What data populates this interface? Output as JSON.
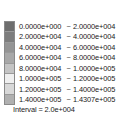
{
  "legend": {
    "interval_label": "Interval =  2.0e+004",
    "separator": "~",
    "rows": [
      {
        "low": "0.0000e+000",
        "high": "2.0000e+004",
        "color": "#6e6e6e"
      },
      {
        "low": "2.0000e+004",
        "high": "4.0000e+004",
        "color": "#7d7d7d"
      },
      {
        "low": "4.0000e+004",
        "high": "6.0000e+004",
        "color": "#949494"
      },
      {
        "low": "6.0000e+004",
        "high": "8.0000e+004",
        "color": "#a8a8a8"
      },
      {
        "low": "8.0000e+004",
        "high": "1.0000e+005",
        "color": "#c4c4c4"
      },
      {
        "low": "1.0000e+005",
        "high": "1.2000e+005",
        "color": "#efefef"
      },
      {
        "low": "1.2000e+005",
        "high": "1.4000e+005",
        "color": "#d8d8d8"
      },
      {
        "low": "1.4000e+005",
        "high": "1.4307e+005",
        "color": "#b0b0b0"
      }
    ]
  },
  "chart_data": {
    "type": "table",
    "title": "",
    "subtitle": "",
    "xlabel": "",
    "ylabel": "",
    "legend_position": "standalone",
    "grid": false,
    "colorbar": {
      "interval": 20000,
      "interval_text": "Interval =  2.0e+004",
      "min": 0.0,
      "max": 143070.0,
      "bin_count": 8,
      "separator": "~",
      "bin_edges": [
        0.0,
        20000.0,
        40000.0,
        60000.0,
        80000.0,
        100000.0,
        120000.0,
        140000.0,
        143070.0
      ],
      "bin_edge_labels": [
        "0.0000e+000",
        "2.0000e+004",
        "4.0000e+004",
        "6.0000e+004",
        "8.0000e+004",
        "1.0000e+005",
        "1.2000e+005",
        "1.4000e+005",
        "1.4307e+005"
      ],
      "bins": [
        {
          "low": 0.0,
          "high": 20000.0,
          "low_label": "0.0000e+000",
          "high_label": "2.0000e+004",
          "color": "#6e6e6e"
        },
        {
          "low": 20000.0,
          "high": 40000.0,
          "low_label": "2.0000e+004",
          "high_label": "4.0000e+004",
          "color": "#7d7d7d"
        },
        {
          "low": 40000.0,
          "high": 60000.0,
          "low_label": "4.0000e+004",
          "high_label": "6.0000e+004",
          "color": "#949494"
        },
        {
          "low": 60000.0,
          "high": 80000.0,
          "low_label": "6.0000e+004",
          "high_label": "8.0000e+004",
          "color": "#a8a8a8"
        },
        {
          "low": 80000.0,
          "high": 100000.0,
          "low_label": "8.0000e+004",
          "high_label": "1.0000e+005",
          "color": "#c4c4c4"
        },
        {
          "low": 100000.0,
          "high": 120000.0,
          "low_label": "1.0000e+005",
          "high_label": "1.2000e+005",
          "color": "#efefef"
        },
        {
          "low": 120000.0,
          "high": 140000.0,
          "low_label": "1.2000e+005",
          "high_label": "1.4000e+005",
          "color": "#d8d8d8"
        },
        {
          "low": 140000.0,
          "high": 143070.0,
          "low_label": "1.4000e+005",
          "high_label": "1.4307e+005",
          "color": "#b0b0b0"
        }
      ]
    }
  }
}
